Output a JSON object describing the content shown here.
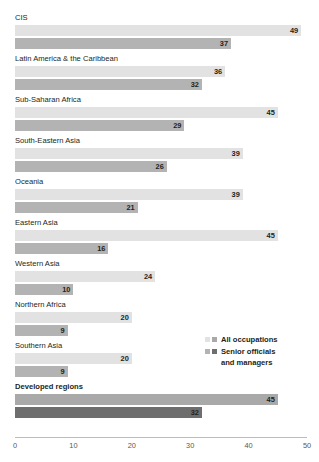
{
  "header": {
    "cut_title": "",
    "cut_title_visible": false
  },
  "legend": {
    "position": "middle-right",
    "items": [
      {
        "label": "All occupations",
        "swatch_light": "#e2e2e2",
        "swatch_dark": "#a9a9a9",
        "continuation": ""
      },
      {
        "label": "Senior officials",
        "swatch_light": "#b3b3b3",
        "swatch_dark": "#6e6e6e",
        "continuation": "and managers"
      }
    ]
  },
  "colors": {
    "bar_all_occupations": "#e2e2e2",
    "bar_senior_officials": "#b3b3b3",
    "bar_all_occupations_highlight": "#a9a9a9",
    "bar_senior_officials_highlight": "#6e6e6e",
    "axis_line": "#bcbcbc",
    "text": "#231f20",
    "tick_text": "#58595b"
  },
  "chart_data": {
    "type": "bar",
    "orientation": "horizontal",
    "title": "",
    "xlabel": "",
    "ylabel": "",
    "xlim": [
      0,
      50
    ],
    "xticks": [
      0,
      10,
      20,
      30,
      40,
      50
    ],
    "grid": false,
    "legend_position": "middle-right",
    "categories": [
      "CIS",
      "Latin America & the Caribbean",
      "Sub-Saharan Africa",
      "South-Eastern Asia",
      "Oceania",
      "Eastern Asia",
      "Western Asia",
      "Northern Africa",
      "Southern Asia",
      "Developed regions"
    ],
    "series": [
      {
        "name": "All occupations",
        "values": [
          49,
          36,
          45,
          39,
          39,
          45,
          24,
          20,
          20,
          45
        ]
      },
      {
        "name": "Senior officials and managers",
        "values": [
          37,
          32,
          29,
          26,
          21,
          16,
          10,
          9,
          9,
          32
        ]
      }
    ],
    "highlighted_category": "Developed regions"
  }
}
